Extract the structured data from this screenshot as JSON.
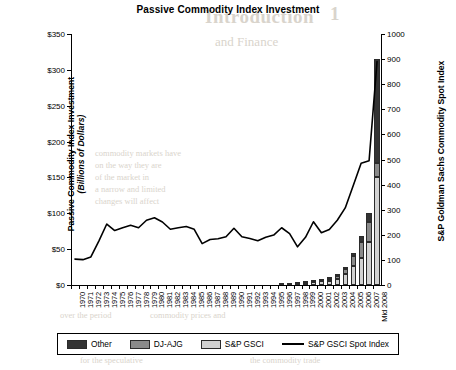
{
  "chart_data": {
    "type": "bar",
    "title": "Passive Commodity Index Investment",
    "xlabel": "",
    "ylabel": "Passive Commodity Index Investment",
    "ylabel_sub": "(Billions of Dollars)",
    "y2label": "S&P Goldman Sachs Commodity Spot Index",
    "ylim": [
      0,
      350
    ],
    "y2lim": [
      0,
      1000
    ],
    "yticks": [
      "$0",
      "$50",
      "$100",
      "$150",
      "$200",
      "$250",
      "$300",
      "$350"
    ],
    "ytick_values": [
      0,
      50,
      100,
      150,
      200,
      250,
      300,
      350
    ],
    "y2ticks": [
      "0",
      "100",
      "200",
      "300",
      "400",
      "500",
      "600",
      "700",
      "800",
      "900",
      "1000"
    ],
    "y2tick_values": [
      0,
      100,
      200,
      300,
      400,
      500,
      600,
      700,
      800,
      900,
      1000
    ],
    "grid": false,
    "legend_position": "bottom",
    "categories": [
      "1970",
      "1971",
      "1972",
      "1973",
      "1974",
      "1975",
      "1976",
      "1977",
      "1978",
      "1979",
      "1980",
      "1981",
      "1982",
      "1983",
      "1984",
      "1985",
      "1986",
      "1987",
      "1988",
      "1989",
      "1990",
      "1991",
      "1992",
      "1993",
      "1994",
      "1995",
      "1996",
      "1997",
      "1998",
      "1999",
      "2000",
      "2001",
      "2002",
      "2003",
      "2004",
      "2005",
      "2006",
      "2007",
      "Mid 2008"
    ],
    "series": [
      {
        "name": "S&P GSCI",
        "color": "#d2d2d2",
        "stack": "investment",
        "values": [
          0,
          0,
          0,
          0,
          0,
          0,
          0,
          0,
          0,
          0,
          0,
          0,
          0,
          0,
          0,
          0,
          0,
          0,
          0,
          0,
          0,
          0,
          0,
          0,
          0,
          0,
          1,
          2,
          2,
          3,
          4,
          5,
          6,
          9,
          16,
          26,
          38,
          60,
          150
        ]
      },
      {
        "name": "DJ-AJG",
        "color": "#8a8a8a",
        "stack": "investment",
        "values": [
          0,
          0,
          0,
          0,
          0,
          0,
          0,
          0,
          0,
          0,
          0,
          0,
          0,
          0,
          0,
          0,
          0,
          0,
          0,
          0,
          0,
          0,
          0,
          0,
          0,
          0,
          0,
          0,
          1,
          1,
          1,
          2,
          2,
          3,
          6,
          14,
          22,
          28,
          20
        ]
      },
      {
        "name": "Other",
        "color": "#333333",
        "stack": "investment",
        "values": [
          0,
          0,
          0,
          0,
          0,
          0,
          0,
          0,
          0,
          0,
          0,
          0,
          0,
          0,
          0,
          0,
          0,
          0,
          0,
          0,
          0,
          0,
          0,
          0,
          0,
          0,
          0,
          0,
          0,
          0,
          0,
          0,
          1,
          1,
          3,
          5,
          8,
          12,
          145
        ]
      },
      {
        "name": "S&P GSCI Spot Index",
        "color": "#000000",
        "type": "line",
        "axis": "right",
        "values": [
          103,
          101,
          112,
          175,
          243,
          217,
          228,
          238,
          228,
          258,
          268,
          251,
          222,
          228,
          233,
          222,
          165,
          181,
          184,
          192,
          226,
          192,
          185,
          176,
          190,
          199,
          228,
          205,
          152,
          190,
          252,
          208,
          221,
          258,
          307,
          395,
          485,
          495,
          890
        ]
      }
    ]
  },
  "legend": {
    "items": [
      {
        "label": "Other",
        "swatch": "dark-gray"
      },
      {
        "label": "DJ-AJG",
        "swatch": "medium-gray"
      },
      {
        "label": "S&P GSCI",
        "swatch": "light-gray"
      },
      {
        "label": "S&P GSCI Spot Index",
        "swatch": "black-line"
      }
    ]
  },
  "ghost_text": {
    "heading_number": "1",
    "heading": "Introduction",
    "subheading": "and Finance",
    "line1": "commodity markets have",
    "line2": "on the way they are",
    "line3": "of the market in",
    "line4": "a narrow and limited",
    "line5": "changes will affect",
    "line6": "over the period",
    "line7": "commodity prices and",
    "line8": "for the speculative",
    "line9": "the commodity trade"
  }
}
